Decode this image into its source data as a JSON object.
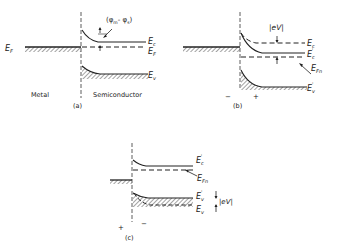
{
  "figure": {
    "panels": [
      {
        "id": "a",
        "caption": "(a)",
        "region_labels": {
          "left": "Metal",
          "right": "Semiconductor"
        },
        "metal_fermi_label": "E",
        "metal_fermi_sub": "F",
        "barrier_label": "(φm - φs)",
        "barrier_phi_m": "φ",
        "barrier_m_sub": "m",
        "barrier_phi_s": "φ",
        "barrier_s_sub": "s",
        "levels": [
          {
            "name": "E",
            "sub": "c",
            "sup": "",
            "style": "solid"
          },
          {
            "name": "E",
            "sub": "F",
            "sup": "",
            "style": "dashed"
          },
          {
            "name": "E",
            "sub": "v",
            "sup": "",
            "style": "solid"
          }
        ]
      },
      {
        "id": "b",
        "caption": "(b)",
        "bias_left": "−",
        "bias_right": "+",
        "voltage_label": "|eV|",
        "levels": [
          {
            "name": "E",
            "sub": "c",
            "sup": "",
            "style": "dashed"
          },
          {
            "name": "E",
            "sub": "c",
            "sup": "'",
            "style": "solid"
          },
          {
            "name": "E",
            "sub": "Fn",
            "sup": "",
            "style": "dashed"
          },
          {
            "name": "E",
            "sub": "v",
            "sup": "'",
            "style": "solid"
          }
        ]
      },
      {
        "id": "c",
        "caption": "(c)",
        "bias_left": "+",
        "bias_right": "−",
        "voltage_label": "|eV|",
        "levels": [
          {
            "name": "E",
            "sub": "c",
            "sup": "'",
            "style": "solid"
          },
          {
            "name": "E",
            "sub": "Fn",
            "sup": "",
            "style": "dashed"
          },
          {
            "name": "E",
            "sub": "v",
            "sup": "'",
            "style": "solid"
          },
          {
            "name": "E",
            "sub": "v",
            "sup": "",
            "style": "dashed"
          }
        ]
      }
    ]
  }
}
